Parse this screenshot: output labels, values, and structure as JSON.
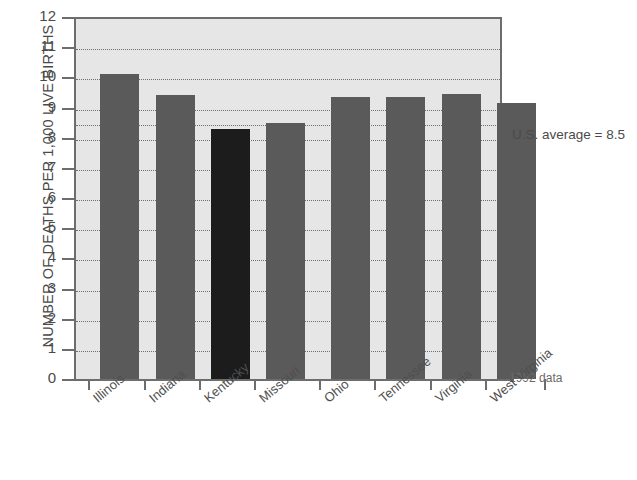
{
  "chart_data": {
    "type": "bar",
    "title": "",
    "subtitle": "",
    "xlabel": "",
    "ylabel": "NUMBER OF DEATHS PER 1,000 LIVE BIRTHS",
    "categories": [
      "Illinois",
      "Indiana",
      "Kentucky",
      "Missouri",
      "Ohio",
      "Tennessee",
      "Virginia",
      "West Virginia"
    ],
    "values": [
      10.1,
      9.4,
      8.3,
      8.5,
      9.35,
      9.35,
      9.45,
      9.15
    ],
    "highlight_category": "Kentucky",
    "ylim": [
      0,
      12
    ],
    "yticks": [
      0,
      1,
      2,
      3,
      4,
      5,
      6,
      7,
      8,
      9,
      10,
      11,
      12
    ],
    "ytick_labels": [
      "0",
      "1",
      "2",
      "3",
      "4",
      "5",
      "6",
      "7",
      "8",
      "9",
      "10",
      "11",
      "12"
    ],
    "gridlines": [
      1,
      2,
      3,
      4,
      5,
      6,
      7,
      8,
      8.5,
      9,
      10,
      11
    ],
    "grid": true,
    "grid_style": "dotted",
    "legend": "none",
    "reference_line": {
      "value": 8.5,
      "label": "U.S. average = 8.5"
    },
    "annotations": [
      {
        "name": "us-average-note",
        "text": "U.S. average = 8.5"
      },
      {
        "name": "data-year-note",
        "text": "1992 data"
      }
    ],
    "colors": {
      "bar": "#5a5a5a",
      "bar_highlight": "#1c1c1c",
      "plot_background": "#e6e6e6",
      "axis": "#6d6d6d",
      "grid": "#6f6f6f",
      "text": "#4a4a4a"
    }
  },
  "axis": {
    "y_title": "NUMBER OF DEATHS PER 1,000 LIVE BIRTHS"
  },
  "notes": {
    "average": "U.S. average = 8.5",
    "year": "1992 data"
  }
}
